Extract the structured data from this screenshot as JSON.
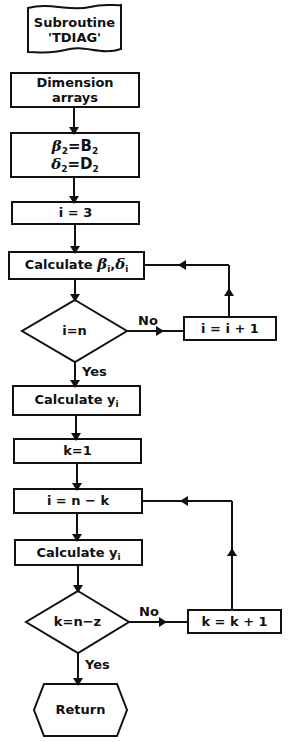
{
  "diagram": {
    "type": "flowchart",
    "nodes": {
      "start": {
        "shape": "flag",
        "line1": "Subroutine",
        "line2": "'TDIAG'"
      },
      "dimension": {
        "shape": "process",
        "line1": "Dimension",
        "line2": "arrays"
      },
      "init_beta_delta": {
        "shape": "process",
        "beta_lhs": "β",
        "beta_sub": "2",
        "beta_rhs": "=B",
        "beta_rhs_sub": "2",
        "delta_lhs": "δ",
        "delta_sub": "2",
        "delta_rhs": "=D",
        "delta_rhs_sub": "2"
      },
      "init_i": {
        "shape": "process",
        "text": "i = 3"
      },
      "calc_beta_delta": {
        "shape": "process",
        "prefix": "Calculate ",
        "beta": "β",
        "beta_sub": "i",
        "sep": ",",
        "delta": "δ",
        "delta_sub": "i"
      },
      "decision_i": {
        "shape": "decision",
        "text": "i=n"
      },
      "increment_i": {
        "shape": "process",
        "text": "i = i + 1"
      },
      "calc_y_1": {
        "shape": "process",
        "prefix": "Calculate ",
        "var": "y",
        "sub": "i"
      },
      "init_k": {
        "shape": "process",
        "text": "k=1"
      },
      "set_i": {
        "shape": "process",
        "text": "i = n − k"
      },
      "calc_y_2": {
        "shape": "process",
        "prefix": "Calculate ",
        "var": "y",
        "sub": "i"
      },
      "decision_k": {
        "shape": "decision",
        "text": "k=n−z"
      },
      "increment_k": {
        "shape": "process",
        "text": "k = k + 1"
      },
      "end": {
        "shape": "terminator-hexagon",
        "text": "Return"
      }
    },
    "edge_labels": {
      "decision_i_no": "No",
      "decision_i_yes": "Yes",
      "decision_k_no": "No",
      "decision_k_yes": "Yes"
    },
    "edges": [
      [
        "dimension",
        "init_beta_delta"
      ],
      [
        "init_beta_delta",
        "init_i"
      ],
      [
        "init_i",
        "calc_beta_delta"
      ],
      [
        "calc_beta_delta",
        "decision_i"
      ],
      [
        "decision_i",
        "increment_i",
        "No"
      ],
      [
        "increment_i",
        "calc_beta_delta"
      ],
      [
        "decision_i",
        "calc_y_1",
        "Yes"
      ],
      [
        "calc_y_1",
        "init_k"
      ],
      [
        "init_k",
        "set_i"
      ],
      [
        "set_i",
        "calc_y_2"
      ],
      [
        "calc_y_2",
        "decision_k"
      ],
      [
        "decision_k",
        "increment_k",
        "No"
      ],
      [
        "increment_k",
        "set_i"
      ],
      [
        "decision_k",
        "end",
        "Yes"
      ]
    ],
    "colors": {
      "stroke": "#111111",
      "background": "#ffffff"
    }
  }
}
